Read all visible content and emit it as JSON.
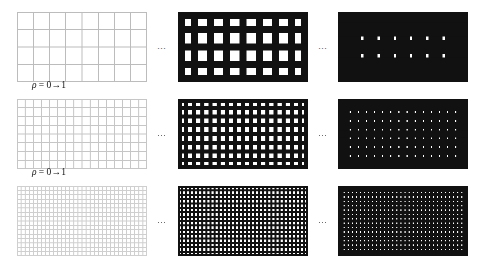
{
  "figure": {
    "title": "",
    "background_color": "#ffffff",
    "rows": [
      {
        "id": "row-coarse",
        "grid_cols": 8,
        "grid_rows": 4,
        "label": "ρ = 0→1",
        "label_symbol": "ρ",
        "label_equals": "=",
        "label_from": "0",
        "label_arrow": "→",
        "label_to": "1",
        "panels": [
          {
            "id": "row1-panel-left",
            "rho": 0,
            "line_color": "#bcbcbc",
            "line_width_px": 1,
            "cell_color": "#ffffff",
            "description": "thin light grid, 8 by 4 cells"
          },
          {
            "id": "row1-panel-middle",
            "rho": 0.5,
            "line_color": "#111111",
            "line_width_px": 7,
            "cell_color": "#ffffff",
            "description": "thick black grid lines, white square cells"
          },
          {
            "id": "row1-panel-right",
            "rho": 1,
            "line_color": "#111111",
            "line_width_px": 14,
            "cell_color": "#ffffff",
            "description": "black field with small white squares"
          }
        ],
        "separators": [
          "…",
          "…"
        ]
      },
      {
        "id": "row-medium",
        "grid_cols": 16,
        "grid_rows": 8,
        "label": "ρ = 0→1",
        "label_symbol": "ρ",
        "label_equals": "=",
        "label_from": "0",
        "label_arrow": "→",
        "label_to": "1",
        "panels": [
          {
            "id": "row2-panel-left",
            "rho": 0,
            "line_color": "#c6c6c6",
            "line_width_px": 1,
            "cell_color": "#ffffff",
            "description": "thin light grid, 16 by 8 cells"
          },
          {
            "id": "row2-panel-middle",
            "rho": 0.5,
            "line_color": "#111111",
            "line_width_px": 4,
            "cell_color": "#ffffff",
            "description": "medium black grid lines, white square cells"
          },
          {
            "id": "row2-panel-right",
            "rho": 1,
            "line_color": "#111111",
            "line_width_px": 7,
            "cell_color": "#ffffff",
            "description": "black field with small white squares"
          }
        ],
        "separators": [
          "…",
          "…"
        ]
      },
      {
        "id": "row-fine",
        "grid_cols": 32,
        "grid_rows": 16,
        "label": "",
        "panels": [
          {
            "id": "row3-panel-left",
            "rho": 0,
            "line_color": "#cfcfcf",
            "line_width_px": 1,
            "cell_color": "#ffffff",
            "description": "thin light grid, 32 by 16 cells"
          },
          {
            "id": "row3-panel-middle",
            "rho": 0.5,
            "line_color": "#111111",
            "line_width_px": 2,
            "cell_color": "#ffffff",
            "description": "fine black grid lines, white square cells"
          },
          {
            "id": "row3-panel-right",
            "rho": 1,
            "line_color": "#111111",
            "line_width_px": 3,
            "cell_color": "#ffffff",
            "description": "black field with tiny white squares"
          }
        ],
        "separators": [
          "…",
          "…"
        ]
      }
    ],
    "geometry": {
      "panel_width": 130,
      "panel_height": 70,
      "panel_left_x": 17,
      "panel_middle_x": 178,
      "panel_right_x": 338,
      "row_tops": [
        12,
        99,
        186
      ],
      "ellipsis_x": [
        157,
        318
      ],
      "label_x": 32,
      "label_offsets_y": [
        80,
        167
      ]
    }
  }
}
